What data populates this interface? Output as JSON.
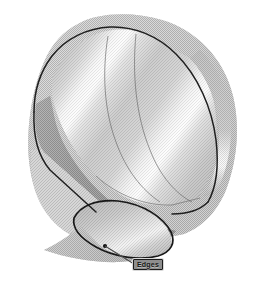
{
  "figure": {
    "title": "Edges",
    "type": "3d-cad-shaded-solid",
    "background_color": "#ffffff",
    "render_style": "dithered-grayscale-shaded"
  },
  "callout": {
    "label": "Edges",
    "box_fill_color": "#8e8e8e",
    "box_border_color": "#1b1b1b",
    "text_color": "#161616",
    "position": {
      "x": 133,
      "y": 259,
      "width": 30,
      "height": 11
    },
    "leader": {
      "from": {
        "x": 134,
        "y": 264
      },
      "to": {
        "x": 105,
        "y": 246
      },
      "color": "#4a4a4a",
      "marker": "vertex-dot"
    }
  },
  "palette": {
    "outer_face_light": "#b9b9b9",
    "outer_face_mid": "#a8a8a8",
    "outer_face_dark": "#8f8f8f",
    "inner_wall_dark": "#6f6f6f",
    "inner_wall_darker": "#5d5d5d",
    "specular_highlight": "#fdfdfd",
    "edge_outline": "#1f1f1f",
    "silhouette_edge": "#2b2b2b",
    "soft_interior_edge": "#565656",
    "background": "#ffffff"
  },
  "geometry": {
    "highlight_bands": [
      {
        "name": "upper-left-specular",
        "orientation": "diagonal",
        "intensity": 0.95
      },
      {
        "name": "central-specular",
        "orientation": "diagonal",
        "intensity": 1.0
      },
      {
        "name": "right-rim-specular",
        "orientation": "vertical",
        "intensity": 0.9
      }
    ],
    "edges": [
      {
        "name": "top-rounded-rim",
        "style": "solid-dark"
      },
      {
        "name": "right-silhouette",
        "style": "solid-dark"
      },
      {
        "name": "bottom-loop",
        "style": "solid-dark",
        "highlighted": true
      },
      {
        "name": "interior-crease",
        "style": "soft-gray"
      }
    ]
  }
}
